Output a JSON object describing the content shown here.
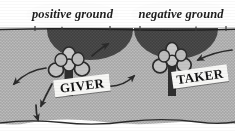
{
  "figure": {
    "style": "scanned halftone line drawing",
    "width": 235,
    "height": 131
  },
  "colors": {
    "paper": "#ffffff",
    "sky": "#ffffff",
    "ground_fill": "#b6b6b6",
    "dome_fill": "#4a4a4a",
    "ink": "#1d1d1d",
    "banner_fill": "#fdfdfd",
    "plaque_fill": "#f7f7f5"
  },
  "banners": [
    {
      "id": "positive",
      "label": "positive ground"
    },
    {
      "id": "negative",
      "label": "negative ground"
    }
  ],
  "plaques": [
    {
      "id": "giver",
      "label": "GIVER"
    },
    {
      "id": "taker",
      "label": "TAKER"
    }
  ],
  "scene": {
    "ground_line_y": 30,
    "bottom_boundary_y": 122,
    "domes": [
      {
        "id": "dome-positive",
        "cx": 90,
        "cy": 30,
        "rx": 43,
        "ry": 30
      },
      {
        "id": "dome-negative",
        "cx": 176,
        "cy": 29,
        "rx": 42,
        "ry": 30
      }
    ],
    "figures": [
      {
        "id": "figure-giver",
        "stem_x": 69,
        "stem_top": 52,
        "stem_bottom": 95
      },
      {
        "id": "figure-taker",
        "stem_x": 172,
        "stem_top": 48,
        "stem_bottom": 96
      }
    ],
    "flow_arrows": [
      {
        "id": "arrow-giver-out-left-upper",
        "direction": "down-left",
        "from": "giver",
        "to": "left-field"
      },
      {
        "id": "arrow-giver-out-left-lower",
        "direction": "down-left",
        "from": "giver",
        "to": "lower-left-field"
      },
      {
        "id": "arrow-giver-out-down",
        "direction": "down",
        "from": "giver",
        "to": "bottom-boundary"
      },
      {
        "id": "arrow-giver-out-right",
        "direction": "up-right",
        "from": "giver",
        "to": "upper-right"
      },
      {
        "id": "arrow-middle-to-taker",
        "direction": "right",
        "from": "mid-field",
        "to": "taker"
      },
      {
        "id": "arrow-right-into-taker",
        "direction": "left",
        "from": "right-field",
        "to": "taker"
      }
    ]
  }
}
